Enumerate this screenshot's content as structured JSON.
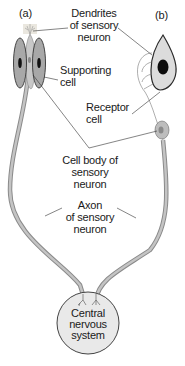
{
  "diagram": {
    "panel_labels": {
      "a": "(a)",
      "b": "(b)"
    },
    "labels": {
      "dendrites": [
        "Dendrites",
        "of sensory",
        "neuron"
      ],
      "supporting_cell": [
        "Supporting",
        "cell"
      ],
      "receptor_cell": [
        "Receptor",
        "cell"
      ],
      "cell_body": [
        "Cell body of",
        "sensory",
        "neuron"
      ],
      "axon": [
        "Axon",
        "of sensory",
        "neuron"
      ],
      "cns": [
        "Central",
        "nervous",
        "system"
      ]
    },
    "colors": {
      "cell_fill": "#b0b0b0",
      "cell_outline": "#3a3a3a",
      "nucleus": "#111111",
      "axon": "#b8b8b8",
      "axon_outline": "#8a8a8a",
      "cns_fill": "#e8e8e8",
      "receptor_fill": "#d8d8d8",
      "leader_line": "#333333"
    }
  }
}
